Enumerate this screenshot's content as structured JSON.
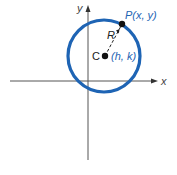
{
  "diagram": {
    "axes": {
      "x_label": "x",
      "y_label": "y"
    },
    "circle": {
      "color": "#1e64b4"
    },
    "points": {
      "center_letter": "C",
      "center_coords": "(h, k)",
      "point_letter": "P",
      "point_coords": "(x, y)",
      "radius_label": "R"
    },
    "colors": {
      "axis": "#555555",
      "label_dark": "#222222",
      "label_blue": "#1e64b4",
      "dot": "#111111"
    }
  }
}
